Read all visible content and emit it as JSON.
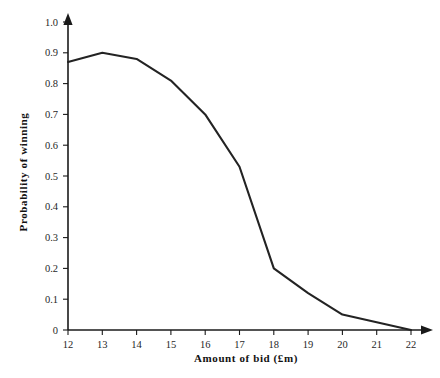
{
  "chart_data": {
    "type": "line",
    "title": "",
    "xlabel": "Amount of bid (£m)",
    "ylabel": "Probability of winning",
    "xlim": [
      12,
      22
    ],
    "ylim": [
      0,
      1.0
    ],
    "grid": false,
    "legend": "none",
    "x": [
      12,
      13,
      14,
      15,
      16,
      17,
      18,
      19,
      20,
      21,
      22
    ],
    "values": [
      0.87,
      0.9,
      0.88,
      0.81,
      0.7,
      0.53,
      0.2,
      0.12,
      0.05,
      0.025,
      0
    ],
    "series": [
      {
        "name": "Probability of winning",
        "values": [
          0.87,
          0.9,
          0.88,
          0.81,
          0.7,
          0.53,
          0.2,
          0.12,
          0.05,
          0.025,
          0
        ]
      }
    ],
    "xticks": [
      "12",
      "13",
      "14",
      "15",
      "16",
      "17",
      "18",
      "19",
      "20",
      "21",
      "22"
    ],
    "yticks": [
      "0",
      "0.1",
      "0.2",
      "0.3",
      "0.4",
      "0.5",
      "0.6",
      "0.7",
      "0.8",
      "0.9",
      "1.0"
    ],
    "xtick_values": [
      12,
      13,
      14,
      15,
      16,
      17,
      18,
      19,
      20,
      21,
      22
    ],
    "ytick_values": [
      0,
      0.1,
      0.2,
      0.3,
      0.4,
      0.5,
      0.6,
      0.7,
      0.8,
      0.9,
      1.0
    ],
    "line_color": "#232323",
    "axis_color": "#1a1a1a",
    "background_color": "#ffffff"
  }
}
